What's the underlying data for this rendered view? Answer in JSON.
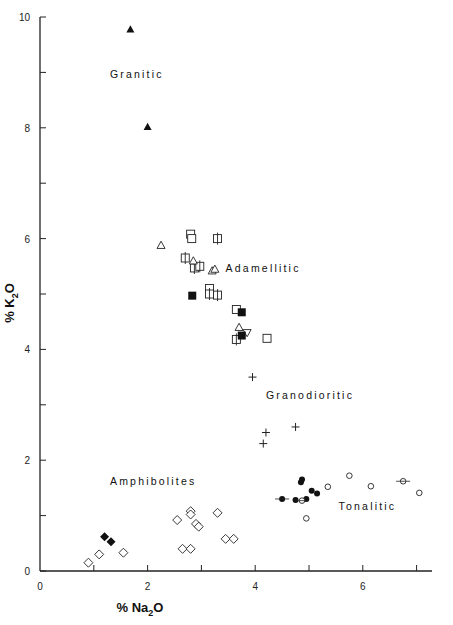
{
  "chart_data": {
    "type": "scatter",
    "title": "",
    "xlabel": "% Na2O",
    "ylabel": "% K2O",
    "xlim": [
      0,
      7.3
    ],
    "ylim": [
      0,
      10
    ],
    "grid": false,
    "legend": "none (region labels inside plot)",
    "x_ticks": [
      0,
      2,
      4,
      6
    ],
    "x_minor_ticks": [
      1,
      3,
      5,
      7
    ],
    "y_ticks": [
      0,
      2,
      4,
      6,
      8,
      10
    ],
    "y_minor_ticks": [
      1,
      3,
      5,
      7,
      9
    ],
    "annotations": [
      {
        "text": "Granitic",
        "x": 1.3,
        "y": 8.9
      },
      {
        "text": "Adamellitic",
        "x": 3.45,
        "y": 5.4
      },
      {
        "text": "Granodioritic",
        "x": 4.2,
        "y": 3.1
      },
      {
        "text": "Amphibolites",
        "x": 1.3,
        "y": 1.55
      },
      {
        "text": "Tonalitic",
        "x": 5.55,
        "y": 1.1
      }
    ],
    "series": [
      {
        "name": "Granitic (filled triangle)",
        "marker": "filled-triangle",
        "points": [
          [
            1.68,
            9.78
          ],
          [
            2.0,
            8.02
          ]
        ]
      },
      {
        "name": "Adamellitic (open square)",
        "marker": "open-square",
        "points": [
          [
            2.8,
            6.08
          ],
          [
            2.82,
            6.0
          ],
          [
            3.15,
            5.1
          ],
          [
            3.65,
            4.72
          ],
          [
            4.22,
            4.2
          ]
        ]
      },
      {
        "name": "Adamellitic (open square with tick)",
        "marker": "open-square-tick",
        "points": [
          [
            2.7,
            5.65
          ],
          [
            2.87,
            5.47
          ],
          [
            2.97,
            5.5
          ],
          [
            3.3,
            6.0
          ],
          [
            3.15,
            5.0
          ],
          [
            3.3,
            4.98
          ],
          [
            3.65,
            4.18
          ]
        ]
      },
      {
        "name": "Adamellitic (open triangle)",
        "marker": "open-triangle",
        "points": [
          [
            2.25,
            5.88
          ],
          [
            2.85,
            5.6
          ],
          [
            3.2,
            5.42
          ],
          [
            3.25,
            5.45
          ],
          [
            3.7,
            4.4
          ]
        ]
      },
      {
        "name": "Adamellitic (open inverted triangle)",
        "marker": "open-inverted-triangle",
        "points": [
          [
            3.85,
            4.3
          ]
        ]
      },
      {
        "name": "Adamellitic (filled square)",
        "marker": "filled-square",
        "points": [
          [
            2.83,
            4.97
          ],
          [
            3.75,
            4.67
          ],
          [
            3.75,
            4.25
          ]
        ]
      },
      {
        "name": "Granodioritic (cross)",
        "marker": "plus",
        "points": [
          [
            3.95,
            3.5
          ],
          [
            4.2,
            2.5
          ],
          [
            4.15,
            2.3
          ],
          [
            4.75,
            2.6
          ]
        ]
      },
      {
        "name": "Tonalitic (filled circle)",
        "marker": "filled-circle",
        "points": [
          [
            4.5,
            1.3
          ],
          [
            4.75,
            1.28
          ],
          [
            4.85,
            1.6
          ],
          [
            4.87,
            1.65
          ],
          [
            4.95,
            1.3
          ],
          [
            5.05,
            1.45
          ],
          [
            5.15,
            1.4
          ]
        ]
      },
      {
        "name": "Tonalitic (open circle)",
        "marker": "open-circle",
        "points": [
          [
            4.87,
            1.27
          ],
          [
            4.95,
            0.95
          ],
          [
            5.35,
            1.52
          ],
          [
            5.75,
            1.72
          ],
          [
            6.15,
            1.53
          ],
          [
            6.75,
            1.62
          ],
          [
            7.05,
            1.41
          ]
        ]
      },
      {
        "name": "Amphibolites (open diamond)",
        "marker": "open-diamond",
        "points": [
          [
            0.9,
            0.15
          ],
          [
            1.1,
            0.3
          ],
          [
            1.55,
            0.33
          ],
          [
            2.55,
            0.92
          ],
          [
            2.8,
            1.08
          ],
          [
            2.8,
            1.02
          ],
          [
            2.9,
            0.85
          ],
          [
            2.95,
            0.8
          ],
          [
            3.3,
            1.05
          ],
          [
            2.65,
            0.4
          ],
          [
            2.8,
            0.4
          ],
          [
            3.45,
            0.58
          ],
          [
            3.6,
            0.58
          ]
        ]
      },
      {
        "name": "Amphibolites (filled diamond)",
        "marker": "filled-diamond",
        "points": [
          [
            1.2,
            0.62
          ],
          [
            1.32,
            0.53
          ]
        ]
      }
    ]
  },
  "footer": {
    "caption_fragment": "K2O vs Na2O plot of the analysed rocks; see legend text in source figure."
  }
}
